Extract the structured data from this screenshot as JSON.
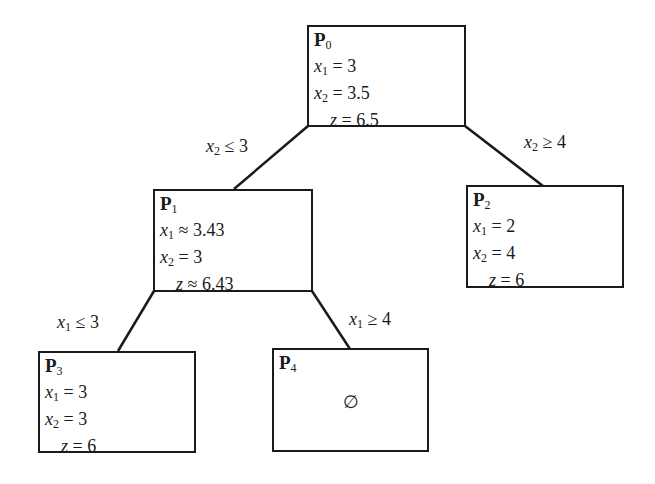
{
  "diagram": {
    "type": "branch-and-bound tree",
    "nodes": {
      "p0": {
        "title": "P",
        "index": "0",
        "rows": [
          {
            "var": "x",
            "sub": "1",
            "op": "=",
            "value": "3"
          },
          {
            "var": "x",
            "sub": "2",
            "op": "=",
            "value": "3.5"
          },
          {
            "var": "z",
            "sub": "",
            "op": "=",
            "value": "6.5"
          }
        ]
      },
      "p1": {
        "title": "P",
        "index": "1",
        "rows": [
          {
            "var": "x",
            "sub": "1",
            "op": "≈",
            "value": "3.43"
          },
          {
            "var": "x",
            "sub": "2",
            "op": "=",
            "value": "3"
          },
          {
            "var": "z",
            "sub": "",
            "op": "≈",
            "value": "6.43"
          }
        ]
      },
      "p2": {
        "title": "P",
        "index": "2",
        "rows": [
          {
            "var": "x",
            "sub": "1",
            "op": "=",
            "value": "2"
          },
          {
            "var": "x",
            "sub": "2",
            "op": "=",
            "value": "4"
          },
          {
            "var": "z",
            "sub": "",
            "op": "=",
            "value": "6"
          }
        ]
      },
      "p3": {
        "title": "P",
        "index": "3",
        "rows": [
          {
            "var": "x",
            "sub": "1",
            "op": "=",
            "value": "3"
          },
          {
            "var": "x",
            "sub": "2",
            "op": "=",
            "value": "3"
          },
          {
            "var": "z",
            "sub": "",
            "op": "=",
            "value": "6"
          }
        ]
      },
      "p4": {
        "title": "P",
        "index": "4",
        "content": "∅"
      }
    },
    "edges": {
      "p0_p1": {
        "var": "x",
        "sub": "2",
        "op": "≤",
        "value": "3"
      },
      "p0_p2": {
        "var": "x",
        "sub": "2",
        "op": "≥",
        "value": "4"
      },
      "p1_p3": {
        "var": "x",
        "sub": "1",
        "op": "≤",
        "value": "3"
      },
      "p1_p4": {
        "var": "x",
        "sub": "1",
        "op": "≥",
        "value": "4"
      }
    },
    "colors": {
      "stroke": "#1a1a1a",
      "background": "#ffffff"
    }
  }
}
